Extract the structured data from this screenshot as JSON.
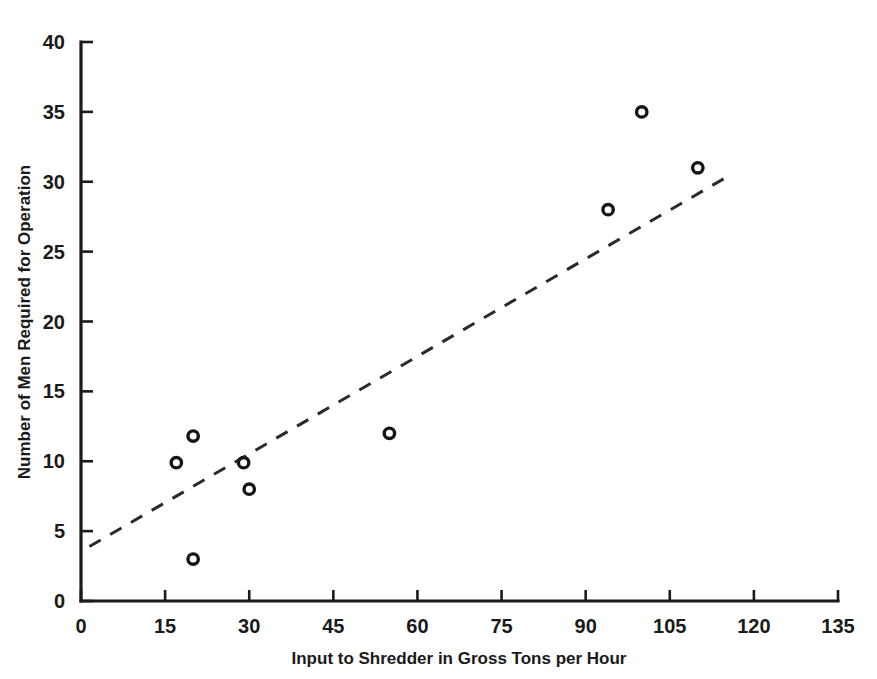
{
  "chart_data": {
    "type": "scatter",
    "title": "",
    "xlabel": "Input to Shredder in Gross Tons per Hour",
    "ylabel": "Number of Men Required for Operation",
    "xlim": [
      0,
      135
    ],
    "ylim": [
      0,
      40
    ],
    "xticks": [
      0,
      15,
      30,
      45,
      60,
      75,
      90,
      105,
      120,
      135
    ],
    "yticks": [
      0,
      5,
      10,
      15,
      20,
      25,
      30,
      35,
      40
    ],
    "xtick_labels": [
      "0",
      "15",
      "30",
      "45",
      "60",
      "75",
      "90",
      "105",
      "120",
      "135"
    ],
    "ytick_labels": [
      "0",
      "5",
      "10",
      "15",
      "20",
      "25",
      "30",
      "35",
      "40"
    ],
    "grid": false,
    "legend": null,
    "marker": "open-circle",
    "points": [
      {
        "x": 17,
        "y": 9.9
      },
      {
        "x": 20,
        "y": 11.8
      },
      {
        "x": 20,
        "y": 3.0
      },
      {
        "x": 29,
        "y": 9.9
      },
      {
        "x": 30,
        "y": 8.0
      },
      {
        "x": 55,
        "y": 12.0
      },
      {
        "x": 94,
        "y": 28.0
      },
      {
        "x": 100,
        "y": 35.0
      },
      {
        "x": 110,
        "y": 31.0
      }
    ],
    "trend_line": {
      "style": "dashed",
      "x_start": 1.5,
      "y_start": 3.9,
      "x_end": 115,
      "y_end": 30.3
    },
    "colors": {
      "axis": "#1a1a1a",
      "marker": "#151515",
      "trend": "#2a2a2a",
      "background": "#ffffff"
    }
  }
}
